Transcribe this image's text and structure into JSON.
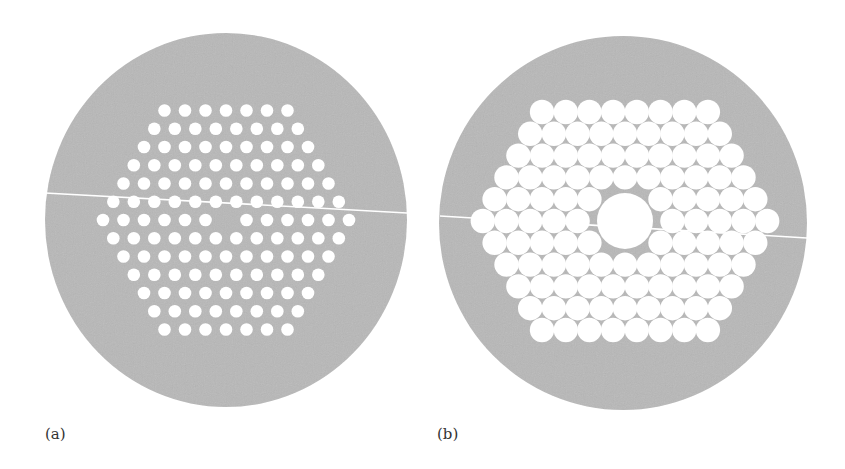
{
  "figure": {
    "panels": [
      {
        "label": "(a)",
        "description": "Solid-core hexagonal photonic crystal fiber cross-section: small air holes in triangular lattice, one central hole missing",
        "cladding": {
          "cx": 226,
          "cy": 220,
          "rx": 181,
          "ry": 187
        },
        "lattice": {
          "rows": 13,
          "row_counts": [
            7,
            8,
            9,
            10,
            11,
            12,
            13,
            12,
            11,
            10,
            9,
            8,
            7
          ],
          "center_x": 226,
          "center_y": 220,
          "pitch_x": 20.5,
          "pitch_y": 18.25,
          "hole_radius": 6.3,
          "missing_center": true,
          "core_radius": 0
        },
        "cleave_line": {
          "x1": 45,
          "y1": 193,
          "x2": 407,
          "y2": 213
        }
      },
      {
        "label": "(b)",
        "description": "Hollow-core photonic bandgap fiber cross-section: large close-packed air holes in hexagonal lattice with enlarged central core",
        "cladding": {
          "cx": 623,
          "cy": 223,
          "rx": 184,
          "ry": 187
        },
        "lattice": {
          "rows": 11,
          "row_counts": [
            8,
            9,
            10,
            11,
            12,
            13,
            12,
            11,
            10,
            9,
            8
          ],
          "center_x": 625,
          "center_y": 221,
          "pitch_x": 23.7,
          "pitch_y": 21.8,
          "hole_radius": 12.2,
          "missing_center": true,
          "core_radius": 28
        },
        "cleave_line": {
          "x1": 440,
          "y1": 216,
          "x2": 807,
          "y2": 238
        }
      }
    ],
    "colors": {
      "cladding": "#b8b8b8",
      "holes": "#ffffff",
      "background": "#ffffff",
      "label": "#333333"
    }
  }
}
